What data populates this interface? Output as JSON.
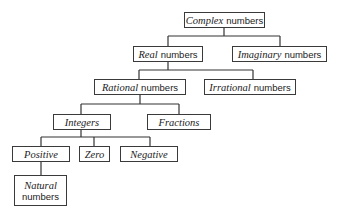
{
  "diagram": {
    "type": "tree",
    "nodes": {
      "complex": {
        "em": "Complex",
        "plain": "numbers"
      },
      "real": {
        "em": "Real",
        "plain": "numbers"
      },
      "imaginary": {
        "em": "Imaginary",
        "plain": "numbers"
      },
      "rational": {
        "em": "Rational",
        "plain": "numbers"
      },
      "irrational": {
        "em": "Irrational",
        "plain": "numbers"
      },
      "integers": {
        "em": "Integers",
        "plain": ""
      },
      "fractions": {
        "em": "Fractions",
        "plain": ""
      },
      "positive": {
        "em": "Positive",
        "plain": ""
      },
      "zero": {
        "em": "Zero",
        "plain": ""
      },
      "negative": {
        "em": "Negative",
        "plain": ""
      },
      "natural": {
        "em": "Natural",
        "plain": "numbers"
      }
    },
    "edges": [
      [
        "complex",
        "real"
      ],
      [
        "complex",
        "imaginary"
      ],
      [
        "real",
        "rational"
      ],
      [
        "real",
        "irrational"
      ],
      [
        "rational",
        "integers"
      ],
      [
        "rational",
        "fractions"
      ],
      [
        "integers",
        "positive"
      ],
      [
        "integers",
        "zero"
      ],
      [
        "integers",
        "negative"
      ],
      [
        "positive",
        "natural"
      ]
    ],
    "colors": {
      "line": "#333333",
      "border": "#3a3a3a",
      "text": "#222222",
      "background": "#ffffff"
    }
  }
}
